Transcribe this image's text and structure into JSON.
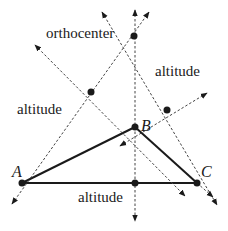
{
  "diagram": {
    "labels": {
      "orthocenter": "orthocenter",
      "altitude_left": "altitude",
      "altitude_right": "altitude",
      "altitude_bottom": "altitude",
      "vertex_a": "A",
      "vertex_b": "B",
      "vertex_c": "C"
    },
    "points": {
      "A": [
        22,
        183
      ],
      "B": [
        135,
        127
      ],
      "C": [
        197,
        183
      ],
      "orthocenter": [
        134,
        36
      ],
      "foot_on_AC": [
        135,
        183
      ],
      "foot_on_AB": [
        91,
        92
      ],
      "foot_on_BC": [
        167,
        110
      ]
    },
    "colors": {
      "line": "#1a1a1a",
      "dashed": "#444444"
    }
  }
}
